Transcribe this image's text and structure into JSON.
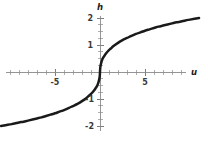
{
  "chart_data": {
    "type": "line",
    "title": "",
    "subtitle": "",
    "xlabel": "u",
    "ylabel": "h",
    "xlim": [
      -11.5,
      11.5
    ],
    "ylim": [
      -2.35,
      2.35
    ],
    "xticks": [
      -5,
      5
    ],
    "xtick_labels": [
      "-5",
      "5"
    ],
    "yticks": [
      -2,
      -1,
      1,
      2
    ],
    "ytick_labels": [
      "-2",
      "-1",
      "1",
      "2"
    ],
    "grid": false,
    "legend": null,
    "legend_position": "none",
    "annotations": [],
    "axis_origin_label": "",
    "minor_tick_step_x": 1,
    "minor_tick_step_y": 0.25,
    "series": [
      {
        "name": "h(u)",
        "x": [
          -11.0,
          -10.5,
          -10.0,
          -9.5,
          -9.0,
          -8.5,
          -8.0,
          -7.5,
          -7.0,
          -6.5,
          -6.0,
          -5.5,
          -5.0,
          -4.5,
          -4.0,
          -3.5,
          -3.0,
          -2.5,
          -2.0,
          -1.5,
          -1.2,
          -1.0,
          -0.8,
          -0.6,
          -0.45,
          -0.3,
          -0.2,
          -0.12,
          -0.06,
          -0.02,
          0.0,
          0.02,
          0.06,
          0.12,
          0.2,
          0.3,
          0.45,
          0.6,
          0.8,
          1.0,
          1.2,
          1.5,
          2.0,
          2.5,
          3.0,
          3.5,
          4.0,
          4.5,
          5.0,
          5.5,
          6.0,
          6.5,
          7.0,
          7.5,
          8.0,
          8.5,
          9.0,
          9.5,
          10.0,
          10.5,
          11.0
        ],
        "y": [
          -2.0,
          -1.97,
          -1.94,
          -1.91,
          -1.87,
          -1.84,
          -1.8,
          -1.76,
          -1.72,
          -1.68,
          -1.63,
          -1.58,
          -1.53,
          -1.47,
          -1.41,
          -1.34,
          -1.26,
          -1.18,
          -1.08,
          -0.96,
          -0.87,
          -0.81,
          -0.74,
          -0.66,
          -0.58,
          -0.5,
          -0.41,
          -0.32,
          -0.23,
          -0.12,
          0.0,
          0.12,
          0.23,
          0.32,
          0.41,
          0.5,
          0.58,
          0.66,
          0.74,
          0.81,
          0.87,
          0.96,
          1.08,
          1.18,
          1.26,
          1.34,
          1.41,
          1.47,
          1.53,
          1.58,
          1.63,
          1.68,
          1.72,
          1.76,
          1.8,
          1.84,
          1.87,
          1.91,
          1.94,
          1.97,
          2.0
        ]
      }
    ]
  },
  "colors": {
    "background": "#ffffff",
    "curve": "#1a1a1a",
    "axis": "#8a8a8a",
    "tick_minor": "#9b9b9b",
    "tick_label": "#3a3a3a",
    "axis_label": "#1a1a1a"
  },
  "labels": {
    "x_axis_name": "u",
    "y_axis_name": "h",
    "x_tick_neg5": "-5",
    "x_tick_pos5": "5",
    "y_tick_pos2": "2",
    "y_tick_pos1": "1",
    "y_tick_neg1": "-1",
    "y_tick_neg2": "-2"
  }
}
